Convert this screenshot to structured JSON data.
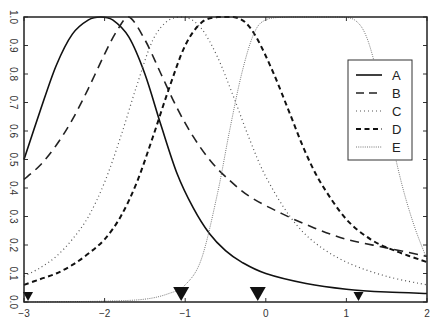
{
  "chart_data": {
    "type": "line",
    "title": "",
    "xlabel": "",
    "ylabel": "",
    "xlim": [
      -3,
      2
    ],
    "ylim": [
      0,
      1
    ],
    "grid": false,
    "legend_position": "right",
    "x_ticks": [
      -3,
      -2,
      -1,
      0,
      1,
      2
    ],
    "x_tick_labels": [
      "−3",
      "−2",
      "−1",
      "0",
      "1",
      "2"
    ],
    "y_ticks": [
      0.0,
      0.1,
      0.2,
      0.3,
      0.4,
      0.5,
      0.6,
      0.7,
      0.8,
      0.9,
      1.0
    ],
    "y_tick_labels": [
      "0.0",
      "0.1",
      "0.2",
      "0.3",
      "0.4",
      "0.5",
      "0.6",
      "0.7",
      "0.8",
      "0.9",
      "1.0"
    ],
    "series": [
      {
        "name": "A",
        "style": "solid",
        "x": [
          -3.0,
          -2.8,
          -2.6,
          -2.4,
          -2.2,
          -2.05,
          -1.9,
          -1.7,
          -1.5,
          -1.3,
          -1.1,
          -0.9,
          -0.7,
          -0.5,
          -0.3,
          0.0,
          0.5,
          1.0,
          1.5,
          2.0
        ],
        "y": [
          0.5,
          0.67,
          0.83,
          0.94,
          0.99,
          1.0,
          0.99,
          0.93,
          0.8,
          0.62,
          0.45,
          0.33,
          0.24,
          0.18,
          0.14,
          0.1,
          0.065,
          0.045,
          0.035,
          0.03
        ]
      },
      {
        "name": "B",
        "style": "long-dash",
        "x": [
          -3.0,
          -2.8,
          -2.6,
          -2.4,
          -2.2,
          -2.0,
          -1.85,
          -1.7,
          -1.5,
          -1.3,
          -1.1,
          -0.9,
          -0.7,
          -0.5,
          -0.2,
          0.2,
          0.6,
          1.0,
          1.5,
          2.0
        ],
        "y": [
          0.43,
          0.48,
          0.55,
          0.64,
          0.75,
          0.87,
          0.95,
          1.0,
          0.92,
          0.8,
          0.68,
          0.58,
          0.5,
          0.44,
          0.37,
          0.31,
          0.26,
          0.22,
          0.19,
          0.16
        ]
      },
      {
        "name": "C",
        "style": "dotted",
        "x": [
          -3.0,
          -2.8,
          -2.6,
          -2.4,
          -2.2,
          -2.0,
          -1.8,
          -1.6,
          -1.4,
          -1.2,
          -1.0,
          -0.8,
          -0.6,
          -0.4,
          -0.2,
          0.0,
          0.3,
          0.6,
          1.0,
          1.5,
          2.0
        ],
        "y": [
          0.09,
          0.12,
          0.16,
          0.22,
          0.3,
          0.42,
          0.58,
          0.76,
          0.92,
          0.99,
          1.0,
          0.96,
          0.86,
          0.72,
          0.57,
          0.44,
          0.3,
          0.21,
          0.14,
          0.09,
          0.06
        ]
      },
      {
        "name": "D",
        "style": "short-dash",
        "x": [
          -3.0,
          -2.8,
          -2.6,
          -2.4,
          -2.2,
          -2.0,
          -1.8,
          -1.6,
          -1.4,
          -1.2,
          -1.0,
          -0.8,
          -0.6,
          -0.4,
          -0.25,
          -0.1,
          0.1,
          0.3,
          0.5,
          0.7,
          1.0,
          1.3,
          1.6,
          2.0
        ],
        "y": [
          0.06,
          0.08,
          0.1,
          0.13,
          0.17,
          0.22,
          0.3,
          0.42,
          0.58,
          0.75,
          0.9,
          0.98,
          1.0,
          1.0,
          0.98,
          0.92,
          0.8,
          0.66,
          0.52,
          0.41,
          0.29,
          0.22,
          0.18,
          0.14
        ]
      },
      {
        "name": "E",
        "style": "fine-dotted",
        "x": [
          -3.0,
          -2.0,
          -1.5,
          -1.2,
          -1.0,
          -0.8,
          -0.6,
          -0.45,
          -0.3,
          -0.15,
          0.0,
          0.3,
          0.6,
          0.9,
          1.1,
          1.25,
          1.4,
          1.55,
          1.7,
          1.85,
          2.0
        ],
        "y": [
          0.0,
          0.003,
          0.01,
          0.03,
          0.06,
          0.15,
          0.38,
          0.6,
          0.8,
          0.94,
          0.99,
          1.0,
          1.0,
          1.0,
          0.99,
          0.93,
          0.78,
          0.58,
          0.4,
          0.26,
          0.15
        ]
      }
    ],
    "markers": [
      {
        "x": -2.95,
        "size": "small"
      },
      {
        "x": -1.05,
        "size": "large"
      },
      {
        "x": -0.1,
        "size": "large"
      },
      {
        "x": 1.15,
        "size": "small"
      }
    ],
    "legend": [
      "A",
      "B",
      "C",
      "D",
      "E"
    ]
  }
}
